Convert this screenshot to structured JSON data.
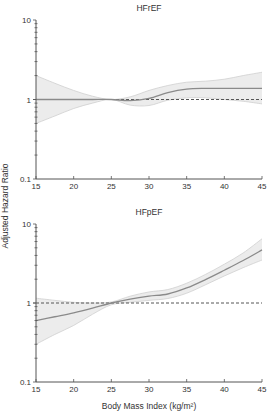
{
  "figure": {
    "ylabel": "Adjusted Hazard Ratio",
    "xlabel": "Body Mass Index (kg/m²)"
  },
  "colors": {
    "line": "#8a8a8a",
    "band": "#e6e6e6",
    "band_edge": "#cfcfcf",
    "reference": "#555555",
    "axis": "#555555"
  },
  "chart_data": [
    {
      "type": "line",
      "title": "HFrEF",
      "xlabel": "",
      "ylabel": "Adjusted Hazard Ratio",
      "xlim": [
        15,
        45
      ],
      "ylim": [
        0.1,
        10
      ],
      "yscale": "log",
      "xticks": [
        15,
        20,
        25,
        30,
        35,
        40,
        45
      ],
      "yticks": [
        0.1,
        1,
        10
      ],
      "ytick_labels": [
        "0.1",
        "1",
        "10"
      ],
      "reference_line": 1,
      "x": [
        15,
        17.5,
        20,
        22.5,
        25,
        27.5,
        30,
        32.5,
        35,
        37.5,
        40,
        42.5,
        45
      ],
      "series": [
        {
          "name": "Hazard ratio",
          "values": [
            1.0,
            1.0,
            1.0,
            1.0,
            1.0,
            0.97,
            1.03,
            1.22,
            1.35,
            1.38,
            1.38,
            1.38,
            1.38
          ]
        },
        {
          "name": "Upper 95% CI",
          "values": [
            2.0,
            1.6,
            1.3,
            1.1,
            1.0,
            1.08,
            1.3,
            1.5,
            1.65,
            1.7,
            1.8,
            2.0,
            2.2
          ]
        },
        {
          "name": "Lower 95% CI",
          "values": [
            0.5,
            0.62,
            0.77,
            0.9,
            1.0,
            0.85,
            0.84,
            0.98,
            1.05,
            1.05,
            1.0,
            0.95,
            0.88
          ]
        }
      ]
    },
    {
      "type": "line",
      "title": "HFpEF",
      "xlabel": "Body Mass Index (kg/m²)",
      "ylabel": "Adjusted Hazard Ratio",
      "xlim": [
        15,
        45
      ],
      "ylim": [
        0.1,
        10
      ],
      "yscale": "log",
      "xticks": [
        15,
        20,
        25,
        30,
        35,
        40,
        45
      ],
      "yticks": [
        0.1,
        1,
        10
      ],
      "ytick_labels": [
        "0.1",
        "1",
        "10"
      ],
      "reference_line": 1,
      "x": [
        15,
        17.5,
        20,
        22.5,
        25,
        27.5,
        30,
        32.5,
        35,
        37.5,
        40,
        42.5,
        45
      ],
      "series": [
        {
          "name": "Hazard ratio",
          "values": [
            0.6,
            0.67,
            0.75,
            0.86,
            1.0,
            1.12,
            1.22,
            1.3,
            1.55,
            1.98,
            2.6,
            3.45,
            4.7
          ]
        },
        {
          "name": "Upper 95% CI",
          "values": [
            1.15,
            1.08,
            1.02,
            1.0,
            1.03,
            1.22,
            1.38,
            1.48,
            1.78,
            2.3,
            3.1,
            4.3,
            6.5
          ]
        },
        {
          "name": "Lower 95% CI",
          "values": [
            0.3,
            0.4,
            0.52,
            0.72,
            0.95,
            1.02,
            1.08,
            1.14,
            1.33,
            1.7,
            2.2,
            2.8,
            3.5
          ]
        }
      ]
    }
  ]
}
